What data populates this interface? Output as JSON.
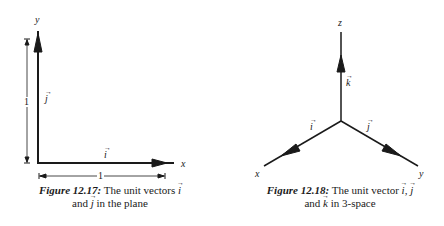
{
  "figure_left": {
    "axes": {
      "x_label": "x",
      "y_label": "y"
    },
    "vectors": {
      "i_label": "i",
      "j_label": "j"
    },
    "dimensions": {
      "vertical": "1",
      "horizontal": "1"
    },
    "caption": {
      "number": "Figure 12.17:",
      "line1_text": "The unit vectors",
      "line1_vec": "i",
      "line2_pre": "and",
      "line2_vec": "j",
      "line2_post": "in the plane"
    }
  },
  "figure_right": {
    "axes": {
      "x_label": "x",
      "y_label": "y",
      "z_label": "z"
    },
    "vectors": {
      "i_label": "i",
      "j_label": "j",
      "k_label": "k"
    },
    "caption": {
      "number": "Figure 12.18:",
      "line1_text": "The unit vector",
      "line1_vec1": "i",
      "line1_sep": ",",
      "line1_vec2": "j",
      "line2_pre": "and",
      "line2_vec": "k",
      "line2_post": "in 3-space"
    }
  },
  "colors": {
    "ink": "#1a1a1a",
    "background": "#ffffff"
  }
}
